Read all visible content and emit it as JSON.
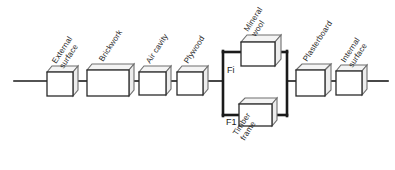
{
  "diagram": {
    "type": "resistance-network",
    "colors": {
      "line": "#1a1a1a",
      "box_face": "#ffffff",
      "box_shade": "#ededed",
      "text": "#2b2b2b",
      "background": "#ffffff"
    },
    "series_layers": [
      {
        "id": "external-surface",
        "label_line1": "External",
        "label_line2": "surface"
      },
      {
        "id": "brickwork",
        "label_line1": "Brickwork",
        "label_line2": ""
      },
      {
        "id": "air-cavity",
        "label_line1": "Air cavity",
        "label_line2": ""
      },
      {
        "id": "plywood",
        "label_line1": "Plywood",
        "label_line2": ""
      },
      {
        "id": "plasterboard",
        "label_line1": "Plasterboard",
        "label_line2": ""
      },
      {
        "id": "internal-surface",
        "label_line1": "Internal",
        "label_line2": "surface"
      }
    ],
    "parallel_block": {
      "upper_branch": {
        "id": "mineral-wool",
        "fraction_label": "Fi",
        "label_line1": "Mineral",
        "label_line2": "wool"
      },
      "lower_branch": {
        "id": "timber-frame",
        "fraction_label": "F1",
        "label_line1": "Timber",
        "label_line2": "frame"
      }
    }
  }
}
